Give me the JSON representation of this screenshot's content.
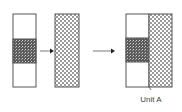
{
  "diagram": {
    "label": "Unit A",
    "colors": {
      "outline": "#555555",
      "dense_pattern": "#6a6a6a",
      "check_pattern": "#9a9a9a",
      "arrow": "#333333"
    }
  }
}
